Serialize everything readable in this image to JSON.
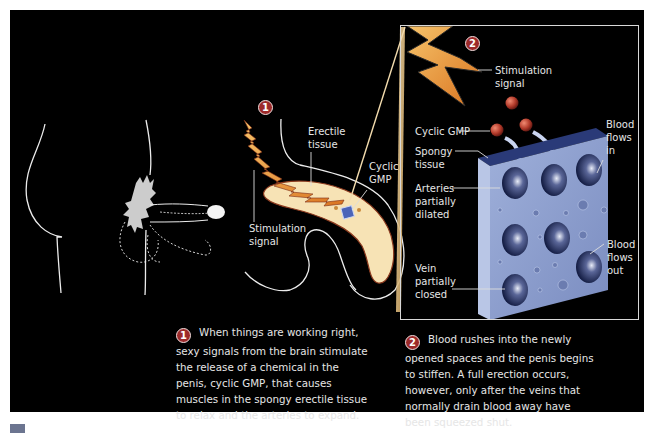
{
  "diagram": {
    "colors": {
      "background": "#000000",
      "step_badge": "#9c2a2a",
      "erectile_tissue": "#f7e3b5",
      "signal_bolt": "#e6953a",
      "spongy_tissue": "#8a9ccc",
      "cyclic_gmp_sphere": "#b23a2a",
      "footer_tab": "#6c7590"
    },
    "left_figure": {
      "description": "outline side-view of male body showing penis flaccid and erect"
    },
    "step1": {
      "badge": "1",
      "labels": {
        "erectile_tissue": "Erectile\ntissue",
        "cyclic_gmp": "Cyclic\nGMP",
        "stimulation_signal": "Stimulation\nsignal"
      }
    },
    "step2": {
      "badge": "2",
      "labels": {
        "stimulation_signal": "Stimulation\nsignal",
        "cyclic_gmp": "Cyclic GMP",
        "spongy_tissue": "Spongy\ntissue",
        "arteries": "Arteries\npartially\ndilated",
        "vein": "Vein\npartially\nclosed",
        "blood_in": "Blood\nflows\nin",
        "blood_out": "Blood\nflows\nout"
      }
    },
    "captions": [
      {
        "badge": "1",
        "text": "When things are working right, sexy signals from the brain stimulate the release of a chemical in the penis, cyclic GMP, that causes muscles in the spongy erectile tissue to relax and the arteries to expand."
      },
      {
        "badge": "2",
        "text": "Blood rushes into the newly opened spaces and the penis begins to stiffen. A full erection occurs, however, only after the veins that normally drain blood away have been squeezed shut."
      }
    ]
  }
}
